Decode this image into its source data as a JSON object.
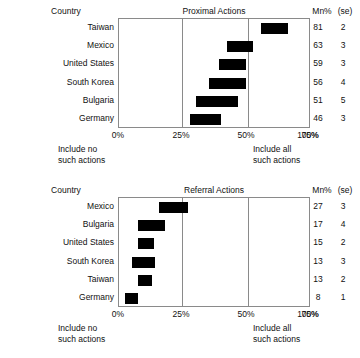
{
  "columns": {
    "country_header": "Country",
    "mn_header": "Mn%",
    "se_header": "(se)"
  },
  "axis": {
    "ticks": [
      "0%",
      "25%",
      "50%",
      "75%",
      "100%"
    ],
    "left_note_line1": "Include no",
    "left_note_line2": "such actions",
    "right_note_line1": "Include all",
    "right_note_line2": "such actions"
  },
  "chart_data": [
    {
      "type": "bar",
      "title": "Proximal Actions",
      "xlabel": "",
      "ylabel": "Country",
      "xlim": [
        0,
        100
      ],
      "xticks": [
        0,
        25,
        50,
        75,
        100
      ],
      "grid": true,
      "legend": "none",
      "orientation": "horizontal",
      "bar_style": "floating interval bar (mean +/- interval)",
      "categories": [
        "Taiwan",
        "Mexico",
        "United States",
        "South Korea",
        "Bulgaria",
        "Germany"
      ],
      "values": [
        81,
        63,
        59,
        56,
        51,
        46
      ],
      "se": [
        2,
        3,
        3,
        4,
        5,
        3
      ],
      "bar_start": [
        74,
        56,
        52,
        47,
        40,
        37
      ],
      "bar_end": [
        88,
        70,
        66,
        66,
        62,
        53
      ],
      "rows": [
        {
          "country": "Taiwan",
          "mn": "81",
          "se": "2",
          "start": 74,
          "end": 88
        },
        {
          "country": "Mexico",
          "mn": "63",
          "se": "3",
          "start": 56,
          "end": 70
        },
        {
          "country": "United States",
          "mn": "59",
          "se": "3",
          "start": 52,
          "end": 66
        },
        {
          "country": "South Korea",
          "mn": "56",
          "se": "4",
          "start": 47,
          "end": 66
        },
        {
          "country": "Bulgaria",
          "mn": "51",
          "se": "5",
          "start": 40,
          "end": 62
        },
        {
          "country": "Germany",
          "mn": "46",
          "se": "3",
          "start": 37,
          "end": 53
        }
      ]
    },
    {
      "type": "bar",
      "title": "Referral Actions",
      "xlabel": "",
      "ylabel": "Country",
      "xlim": [
        0,
        100
      ],
      "xticks": [
        0,
        25,
        50,
        75,
        100
      ],
      "grid": true,
      "legend": "none",
      "orientation": "horizontal",
      "bar_style": "floating interval bar (mean +/- interval)",
      "categories": [
        "Mexico",
        "Bulgaria",
        "United States",
        "South Korea",
        "Taiwan",
        "Germany"
      ],
      "values": [
        27,
        17,
        15,
        13,
        13,
        8
      ],
      "se": [
        3,
        4,
        2,
        3,
        2,
        1
      ],
      "bar_start": [
        21,
        10,
        10,
        7,
        10,
        3
      ],
      "bar_end": [
        36,
        24,
        18,
        19,
        17,
        10
      ],
      "rows": [
        {
          "country": "Mexico",
          "mn": "27",
          "se": "3",
          "start": 21,
          "end": 36
        },
        {
          "country": "Bulgaria",
          "mn": "17",
          "se": "4",
          "start": 10,
          "end": 24
        },
        {
          "country": "United States",
          "mn": "15",
          "se": "2",
          "start": 10,
          "end": 18
        },
        {
          "country": "South Korea",
          "mn": "13",
          "se": "3",
          "start": 7,
          "end": 19
        },
        {
          "country": "Taiwan",
          "mn": "13",
          "se": "2",
          "start": 10,
          "end": 17
        },
        {
          "country": "Germany",
          "mn": "8",
          "se": "1",
          "start": 3,
          "end": 10
        }
      ]
    }
  ]
}
